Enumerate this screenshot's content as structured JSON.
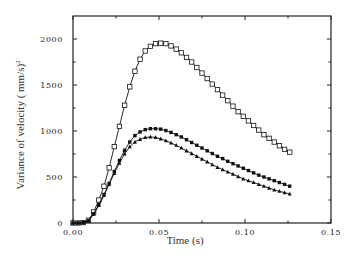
{
  "chart_data": {
    "type": "line",
    "title": "",
    "xlabel": "Time (s)",
    "ylabel": "Variance of velocity ( mm/s)",
    "ylabel_superscript": "2",
    "xlim": [
      0.0,
      0.15
    ],
    "ylim": [
      0,
      2250
    ],
    "xticks": [
      0.0,
      0.05,
      0.1,
      0.15
    ],
    "xtick_labels": [
      "0.00",
      "0.05",
      "0.10",
      "0.15"
    ],
    "yticks": [
      0,
      500,
      1000,
      1500,
      2000
    ],
    "ytick_labels": [
      "0",
      "500",
      "1000",
      "1500",
      "2000"
    ],
    "grid": false,
    "legend": "none",
    "series": [
      {
        "name": "open-square series",
        "marker": "open-square",
        "x": [
          0.0,
          0.003,
          0.006,
          0.009,
          0.012,
          0.015,
          0.018,
          0.021,
          0.024,
          0.027,
          0.03,
          0.033,
          0.036,
          0.039,
          0.042,
          0.045,
          0.048,
          0.051,
          0.054,
          0.057,
          0.06,
          0.063,
          0.066,
          0.069,
          0.072,
          0.075,
          0.078,
          0.081,
          0.084,
          0.087,
          0.09,
          0.093,
          0.096,
          0.099,
          0.102,
          0.105,
          0.108,
          0.111,
          0.114,
          0.117,
          0.12,
          0.123,
          0.126
        ],
        "y": [
          0,
          0,
          5,
          30,
          120,
          250,
          400,
          600,
          830,
          1050,
          1280,
          1480,
          1650,
          1780,
          1870,
          1920,
          1950,
          1955,
          1950,
          1925,
          1890,
          1850,
          1800,
          1750,
          1690,
          1630,
          1570,
          1510,
          1450,
          1390,
          1330,
          1270,
          1210,
          1160,
          1110,
          1060,
          1010,
          960,
          920,
          880,
          840,
          800,
          770
        ]
      },
      {
        "name": "filled-square series",
        "marker": "filled-square",
        "x": [
          0.0,
          0.003,
          0.006,
          0.009,
          0.012,
          0.015,
          0.018,
          0.021,
          0.024,
          0.027,
          0.03,
          0.033,
          0.036,
          0.039,
          0.042,
          0.045,
          0.048,
          0.051,
          0.054,
          0.057,
          0.06,
          0.063,
          0.066,
          0.069,
          0.072,
          0.075,
          0.078,
          0.081,
          0.084,
          0.087,
          0.09,
          0.093,
          0.096,
          0.099,
          0.102,
          0.105,
          0.108,
          0.111,
          0.114,
          0.117,
          0.12,
          0.123,
          0.126
        ],
        "y": [
          0,
          0,
          5,
          25,
          100,
          200,
          310,
          430,
          560,
          680,
          790,
          880,
          950,
          990,
          1015,
          1025,
          1025,
          1020,
          1005,
          985,
          960,
          935,
          905,
          875,
          845,
          815,
          785,
          755,
          725,
          700,
          670,
          645,
          620,
          595,
          570,
          545,
          520,
          500,
          480,
          460,
          440,
          420,
          400
        ]
      },
      {
        "name": "filled-triangle series",
        "marker": "filled-triangle",
        "x": [
          0.0,
          0.003,
          0.006,
          0.009,
          0.012,
          0.015,
          0.018,
          0.021,
          0.024,
          0.027,
          0.03,
          0.033,
          0.036,
          0.039,
          0.042,
          0.045,
          0.048,
          0.051,
          0.054,
          0.057,
          0.06,
          0.063,
          0.066,
          0.069,
          0.072,
          0.075,
          0.078,
          0.081,
          0.084,
          0.087,
          0.09,
          0.093,
          0.096,
          0.099,
          0.102,
          0.105,
          0.108,
          0.111,
          0.114,
          0.117,
          0.12,
          0.123,
          0.126
        ],
        "y": [
          0,
          0,
          5,
          25,
          95,
          190,
          300,
          420,
          540,
          650,
          750,
          830,
          880,
          910,
          930,
          935,
          930,
          915,
          895,
          870,
          845,
          815,
          785,
          755,
          725,
          695,
          665,
          635,
          605,
          580,
          555,
          530,
          505,
          480,
          460,
          440,
          420,
          400,
          380,
          360,
          345,
          330,
          315
        ]
      }
    ]
  }
}
